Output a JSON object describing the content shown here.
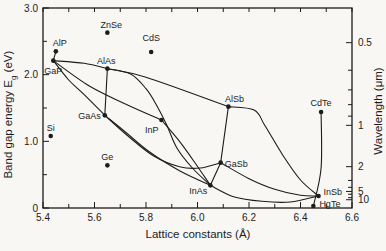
{
  "figure": {
    "background": "#f8f7f4",
    "ink": "#1c1c1c"
  },
  "chart_data": {
    "type": "scatter",
    "xlabel": "Lattice constants (Å)",
    "ylabel_left": {
      "pre": "Band gap energy E",
      "sub": "g",
      "post": " (eV)"
    },
    "ylabel_right": "Wavelength (μm)",
    "x_axis": {
      "min": 5.4,
      "max": 6.6,
      "major_ticks": [
        5.4,
        5.6,
        5.8,
        6.0,
        6.2,
        6.4,
        6.6
      ],
      "labels": [
        "5.4",
        "5.6",
        "5.8",
        "6.0",
        "6.2",
        "6.4",
        "6.6"
      ],
      "minor_ticks": [
        5.5,
        5.7,
        5.9,
        6.1,
        6.3,
        6.5
      ]
    },
    "y_axis_left": {
      "min": 0,
      "max": 3.0,
      "major_ticks": [
        0,
        1.0,
        2.0,
        3.0
      ],
      "labels": [
        "0",
        "1.0",
        "2.0",
        "3.0"
      ],
      "minor_ticks": [
        0.5,
        1.5,
        2.5
      ]
    },
    "y_axis_right": {
      "relation": "wavelength_um = 1.24 / Eg_eV",
      "major_ticks": [
        0.5,
        1,
        2,
        5,
        10
      ],
      "labels": [
        "0.5",
        "1",
        "2",
        "5",
        "10"
      ],
      "minor_ticks": [
        0.6,
        0.7,
        0.8,
        0.9,
        3,
        4,
        6,
        8
      ]
    },
    "points": [
      {
        "name": "Si",
        "a": 5.43,
        "eg": 1.08,
        "anchor": "middle",
        "dx": 0,
        "dy": -5
      },
      {
        "name": "Ge",
        "a": 5.65,
        "eg": 0.64,
        "anchor": "middle",
        "dx": 0,
        "dy": -5
      },
      {
        "name": "AlP",
        "a": 5.45,
        "eg": 2.35,
        "anchor": "middle",
        "dx": 4,
        "dy": -5
      },
      {
        "name": "GaP",
        "a": 5.44,
        "eg": 2.21,
        "anchor": "middle",
        "dx": 0,
        "dy": 13
      },
      {
        "name": "AlAs",
        "a": 5.65,
        "eg": 2.09,
        "anchor": "middle",
        "dx": -1,
        "dy": -5
      },
      {
        "name": "GaAs",
        "a": 5.64,
        "eg": 1.39,
        "anchor": "end",
        "dx": -4,
        "dy": 4
      },
      {
        "name": "InP",
        "a": 5.86,
        "eg": 1.32,
        "anchor": "end",
        "dx": -3,
        "dy": 13
      },
      {
        "name": "InAs",
        "a": 6.05,
        "eg": 0.34,
        "anchor": "end",
        "dx": -3,
        "dy": 9
      },
      {
        "name": "AlSb",
        "a": 6.12,
        "eg": 1.52,
        "anchor": "middle",
        "dx": 6,
        "dy": -5
      },
      {
        "name": "GaSb",
        "a": 6.09,
        "eg": 0.68,
        "anchor": "start",
        "dx": 4,
        "dy": 4
      },
      {
        "name": "InSb",
        "a": 6.47,
        "eg": 0.18,
        "anchor": "start",
        "dx": 5,
        "dy": -1
      },
      {
        "name": "HgTe",
        "a": 6.45,
        "eg": 0.03,
        "anchor": "start",
        "dx": 6,
        "dy": 1
      },
      {
        "name": "CdTe",
        "a": 6.48,
        "eg": 1.44,
        "anchor": "middle",
        "dx": 0,
        "dy": -6
      },
      {
        "name": "ZnSe",
        "a": 5.65,
        "eg": 2.63,
        "anchor": "middle",
        "dx": 4,
        "dy": -5
      },
      {
        "name": "CdS",
        "a": 5.82,
        "eg": 2.34,
        "anchor": "middle",
        "dx": 0,
        "dy": -11
      }
    ],
    "curves": [
      {
        "from": "AlP",
        "to": "GaP",
        "pts": [
          [
            5.45,
            2.35
          ],
          [
            5.44,
            2.21
          ]
        ]
      },
      {
        "from": "GaP",
        "to": "AlAs",
        "pts": [
          [
            5.44,
            2.21
          ],
          [
            5.56,
            2.17
          ],
          [
            5.65,
            2.09
          ]
        ]
      },
      {
        "from": "GaP",
        "to": "GaAs",
        "pts": [
          [
            5.44,
            2.21
          ],
          [
            5.5,
            1.92
          ],
          [
            5.56,
            1.7
          ],
          [
            5.64,
            1.39
          ]
        ]
      },
      {
        "from": "GaP",
        "to": "InP",
        "pts": [
          [
            5.44,
            2.21
          ],
          [
            5.58,
            1.83
          ],
          [
            5.72,
            1.56
          ],
          [
            5.86,
            1.32
          ]
        ]
      },
      {
        "from": "AlAs",
        "to": "GaAs",
        "pts": [
          [
            5.65,
            2.09
          ],
          [
            5.64,
            1.39
          ]
        ]
      },
      {
        "from": "AlAs",
        "to": "AlSb",
        "pts": [
          [
            5.65,
            2.09
          ],
          [
            5.8,
            1.96
          ],
          [
            6.12,
            1.52
          ]
        ]
      },
      {
        "from": "AlAs",
        "to": "InAs",
        "pts": [
          [
            5.65,
            2.09
          ],
          [
            5.74,
            2.01
          ],
          [
            5.8,
            1.79
          ],
          [
            5.84,
            1.55
          ],
          [
            5.88,
            1.25
          ],
          [
            5.92,
            0.9
          ],
          [
            5.98,
            0.6
          ],
          [
            6.05,
            0.34
          ]
        ]
      },
      {
        "from": "InP",
        "to": "InAs",
        "pts": [
          [
            5.86,
            1.32
          ],
          [
            5.93,
            1.0
          ],
          [
            5.99,
            0.68
          ],
          [
            6.05,
            0.34
          ]
        ]
      },
      {
        "from": "GaAs",
        "to": "InAs",
        "pts": [
          [
            5.64,
            1.39
          ],
          [
            5.72,
            1.14
          ],
          [
            5.81,
            0.85
          ],
          [
            5.93,
            0.56
          ],
          [
            6.05,
            0.34
          ]
        ]
      },
      {
        "from": "GaAs",
        "to": "GaSb",
        "pts": [
          [
            5.64,
            1.39
          ],
          [
            5.73,
            1.08
          ],
          [
            5.83,
            0.78
          ],
          [
            5.93,
            0.62
          ],
          [
            6.01,
            0.6
          ],
          [
            6.09,
            0.68
          ]
        ]
      },
      {
        "from": "AlSb",
        "to": "GaSb",
        "pts": [
          [
            6.12,
            1.52
          ],
          [
            6.09,
            0.68
          ]
        ]
      },
      {
        "from": "AlSb",
        "to": "InSb",
        "pts": [
          [
            6.12,
            1.52
          ],
          [
            6.22,
            1.47
          ],
          [
            6.26,
            1.25
          ],
          [
            6.33,
            0.8
          ],
          [
            6.4,
            0.42
          ],
          [
            6.47,
            0.18
          ]
        ]
      },
      {
        "from": "GaSb",
        "to": "InSb",
        "pts": [
          [
            6.09,
            0.68
          ],
          [
            6.2,
            0.44
          ],
          [
            6.3,
            0.28
          ],
          [
            6.4,
            0.19
          ],
          [
            6.47,
            0.18
          ]
        ]
      },
      {
        "from": "InAs",
        "to": "GaSb",
        "pts": [
          [
            6.05,
            0.34
          ],
          [
            6.09,
            0.68
          ]
        ]
      },
      {
        "from": "InAs",
        "to": "InSb",
        "pts": [
          [
            6.05,
            0.34
          ],
          [
            6.14,
            0.17
          ],
          [
            6.25,
            0.1
          ],
          [
            6.36,
            0.09
          ],
          [
            6.47,
            0.18
          ]
        ]
      },
      {
        "from": "CdTe",
        "to": "HgTe",
        "pts": [
          [
            6.48,
            1.44
          ],
          [
            6.48,
            0.6
          ],
          [
            6.45,
            0.03
          ]
        ]
      }
    ]
  }
}
